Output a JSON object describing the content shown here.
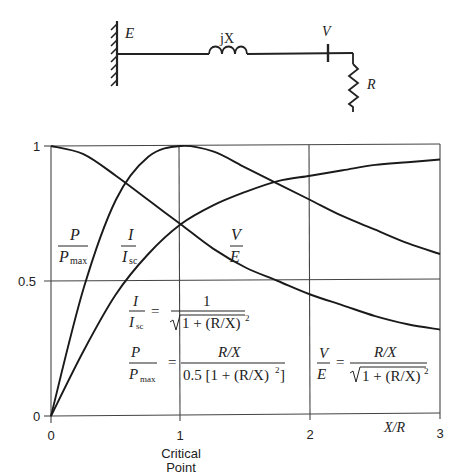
{
  "circuit": {
    "source_label": "E",
    "reactance_label": "jX",
    "voltage_label": "V",
    "load_label": "R"
  },
  "chart_data": {
    "type": "line",
    "title": "",
    "xlabel": "X/R",
    "ylabel": "",
    "xlim": [
      0,
      3
    ],
    "ylim": [
      0,
      1
    ],
    "x_ticks": [
      "0",
      "1",
      "2",
      "3"
    ],
    "y_ticks": [
      "0",
      "0.5",
      "1"
    ],
    "x_tick_annotation": {
      "at": 1,
      "text_line1": "Critical",
      "text_line2": "Point"
    },
    "grid": true,
    "legend_position": "inline labels",
    "x": [
      0,
      0.25,
      0.5,
      0.75,
      1,
      1.25,
      1.5,
      1.75,
      2,
      2.25,
      2.5,
      2.75,
      3
    ],
    "series": [
      {
        "name": "P/Pmax",
        "formula": "P/Pmax = (R/X) / (0.5 [1 + (R/X)^2])",
        "values": [
          0,
          0.47,
          0.8,
          0.96,
          1.0,
          0.98,
          0.92,
          0.86,
          0.8,
          0.74,
          0.69,
          0.64,
          0.6
        ]
      },
      {
        "name": "I/Isc",
        "formula": "I/Isc = 1 / sqrt(1 + (R/X)^2)",
        "values": [
          0,
          0.24,
          0.45,
          0.6,
          0.71,
          0.78,
          0.83,
          0.87,
          0.89,
          0.91,
          0.93,
          0.94,
          0.95
        ]
      },
      {
        "name": "V/E",
        "formula": "V/E = (R/X) / sqrt(1 + (R/X)^2)",
        "values": [
          1,
          0.97,
          0.89,
          0.8,
          0.71,
          0.62,
          0.55,
          0.5,
          0.45,
          0.41,
          0.37,
          0.34,
          0.32
        ]
      }
    ]
  },
  "labels": {
    "p_num": "P",
    "p_den": "P",
    "p_sub": "max",
    "i_num": "I",
    "i_den": "I",
    "i_sub": "sc",
    "v_num": "V",
    "v_den": "E"
  },
  "formulas": {
    "i_rhs_num": "1",
    "i_rhs_den": "1 + (R/X)",
    "p_rhs_num": "R/X",
    "p_rhs_den": "0.5 [1 + (R/X)",
    "p_rhs_den_end": "]",
    "v_rhs_num": "R/X",
    "v_rhs_den": "1 + (R/X)",
    "exp": "2",
    "equals": "="
  }
}
